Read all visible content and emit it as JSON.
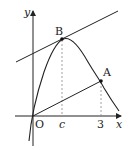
{
  "figure": {
    "axes": {
      "x_label": "x",
      "y_label": "y",
      "origin_label": "O"
    },
    "x_ticks": [
      {
        "label": "c"
      },
      {
        "label": "3"
      }
    ],
    "points": [
      {
        "label": "B"
      },
      {
        "label": "A"
      }
    ],
    "colors": {
      "ink": "#222222",
      "guide": "#888888",
      "background": "#ffffff"
    }
  }
}
